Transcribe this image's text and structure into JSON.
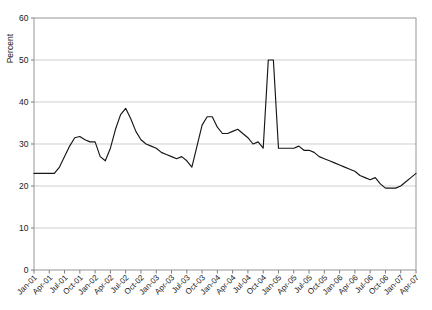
{
  "chart_data": {
    "type": "line",
    "title": "",
    "xlabel": "",
    "ylabel": "Percent",
    "ylim": [
      0,
      60
    ],
    "yticks": [
      0,
      10,
      20,
      30,
      40,
      50,
      60
    ],
    "grid": true,
    "legend": "none",
    "x_tick_labels": [
      "Jan-01",
      "Apr-01",
      "Jul-01",
      "Oct-01",
      "Jan-02",
      "Apr-02",
      "Jul-02",
      "Oct-02",
      "Jan-03",
      "Apr-03",
      "Jul-03",
      "Oct-03",
      "Jan-04",
      "Apr-04",
      "Jul-04",
      "Oct-04",
      "Jan-05",
      "Apr-05",
      "Jul-05",
      "Oct-05",
      "Jan-06",
      "Apr-06",
      "Jul-06",
      "Oct-06",
      "Jan-07",
      "Apr-07"
    ],
    "x": [
      "Jan-01",
      "Feb-01",
      "Mar-01",
      "Apr-01",
      "May-01",
      "Jun-01",
      "Jul-01",
      "Aug-01",
      "Sep-01",
      "Oct-01",
      "Nov-01",
      "Dec-01",
      "Jan-02",
      "Feb-02",
      "Mar-02",
      "Apr-02",
      "May-02",
      "Jun-02",
      "Jul-02",
      "Aug-02",
      "Sep-02",
      "Oct-02",
      "Nov-02",
      "Dec-02",
      "Jan-03",
      "Feb-03",
      "Mar-03",
      "Apr-03",
      "May-03",
      "Jun-03",
      "Jul-03",
      "Aug-03",
      "Sep-03",
      "Oct-03",
      "Nov-03",
      "Dec-03",
      "Jan-04",
      "Feb-04",
      "Mar-04",
      "Apr-04",
      "May-04",
      "Jun-04",
      "Jul-04",
      "Aug-04",
      "Sep-04",
      "Oct-04",
      "Nov-04",
      "Dec-04",
      "Jan-05",
      "Feb-05",
      "Mar-05",
      "Apr-05",
      "May-05",
      "Jun-05",
      "Jul-05",
      "Aug-05",
      "Sep-05",
      "Oct-05",
      "Nov-05",
      "Dec-05",
      "Jan-06",
      "Feb-06",
      "Mar-06",
      "Apr-06",
      "May-06",
      "Jun-06",
      "Jul-06",
      "Aug-06",
      "Sep-06",
      "Oct-06",
      "Nov-06",
      "Dec-06",
      "Jan-07",
      "Feb-07",
      "Mar-07",
      "Apr-07"
    ],
    "series": [
      {
        "name": "Percent",
        "values": [
          23.0,
          23.0,
          23.0,
          23.0,
          23.0,
          24.5,
          27.0,
          29.5,
          31.5,
          31.8,
          31.0,
          30.5,
          30.5,
          27.0,
          26.0,
          29.0,
          33.5,
          37.0,
          38.5,
          36.0,
          33.0,
          31.0,
          30.0,
          29.5,
          29.0,
          28.0,
          27.5,
          27.0,
          26.5,
          27.0,
          26.0,
          24.5,
          29.5,
          34.5,
          36.5,
          36.5,
          34.0,
          32.5,
          32.5,
          33.0,
          33.5,
          32.5,
          31.5,
          30.0,
          30.5,
          29.0,
          50.0,
          50.0,
          29.0,
          29.0,
          29.0,
          29.0,
          29.5,
          28.5,
          28.5,
          28.0,
          27.0,
          26.5,
          26.0,
          25.5,
          25.0,
          24.5,
          24.0,
          23.5,
          22.5,
          22.0,
          21.5,
          22.0,
          20.5,
          19.5,
          19.5,
          19.5,
          20.0,
          21.0,
          22.0,
          23.0
        ]
      }
    ],
    "annotations": [
      {
        "label": "spike-peak",
        "value": 50.0,
        "at": "Nov-04"
      },
      {
        "label": "series-minimum",
        "value": 19.5,
        "at": "Oct-05"
      },
      {
        "label": "series-start",
        "value": 23.0,
        "at": "Jan-01"
      },
      {
        "label": "series-end",
        "value": 26.8,
        "at": "Apr-07"
      }
    ]
  },
  "plot": {
    "y_axis_label": "Percent"
  }
}
